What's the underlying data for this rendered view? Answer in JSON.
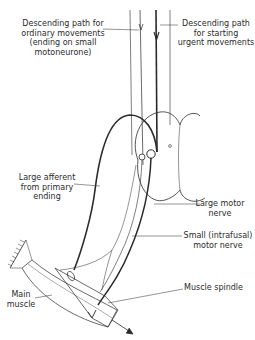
{
  "figure": {
    "type": "anatomical-diagram"
  },
  "labels": {
    "descending_ordinary": "Descending path for\nordinary movements\n(ending on small\nmotoneurone)",
    "descending_urgent": "Descending path\nfor starting\nurgent movements",
    "large_afferent": "Large afferent\nfrom primary\nending",
    "large_motor": "Large motor\nnerve",
    "small_motor": "Small (intrafusal)\nmotor nerve",
    "main_muscle": "Main\nmuscle",
    "muscle_spindle": "Muscle spindle"
  },
  "colors": {
    "ink": "#2a2a2a",
    "background": "#ffffff"
  }
}
